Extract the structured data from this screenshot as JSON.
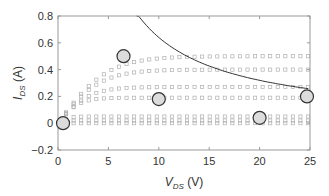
{
  "chart_data": {
    "type": "scatter",
    "title": "",
    "xlabel": "V_DS (V)",
    "xlabel_main": "V",
    "xlabel_sub": "DS",
    "xlabel_unit": " (V)",
    "ylabel": "I_DS (A)",
    "ylabel_main": "I",
    "ylabel_sub": "DS",
    "ylabel_unit": " (A)",
    "xlim": [
      0,
      25
    ],
    "ylim": [
      -0.2,
      0.8
    ],
    "xticks": [
      0,
      5,
      10,
      15,
      20,
      25
    ],
    "yticks": [
      -0.2,
      0,
      0.2,
      0.4,
      0.6,
      0.8
    ],
    "xtick_labels": [
      "0",
      "5",
      "10",
      "15",
      "20",
      "25"
    ],
    "ytick_labels": [
      "−0.2",
      "0",
      "0.2",
      "0.4",
      "0.6",
      "0.8"
    ],
    "grid": false,
    "legend": null,
    "series": [
      {
        "name": "I-V curve 1",
        "marker": "square",
        "saturation_current": 0.5,
        "knee_voltage": 7
      },
      {
        "name": "I-V curve 2",
        "marker": "square",
        "saturation_current": 0.4,
        "knee_voltage": 6
      },
      {
        "name": "I-V curve 3",
        "marker": "square",
        "saturation_current": 0.27,
        "knee_voltage": 4.5
      },
      {
        "name": "I-V curve 4",
        "marker": "square",
        "saturation_current": 0.19,
        "knee_voltage": 3
      },
      {
        "name": "I-V curve 5",
        "marker": "square",
        "saturation_current": 0.05,
        "knee_voltage": 1.5
      },
      {
        "name": "I-V curve 6",
        "marker": "square",
        "saturation_current": 0.02,
        "knee_voltage": 1
      },
      {
        "name": "I-V curve 7",
        "marker": "square",
        "saturation_current": 0.0,
        "knee_voltage": 0.5
      }
    ],
    "power_limit_curve": {
      "name": "max power hyperbola",
      "style": "solid line",
      "power_W": 6.4,
      "x_start": 7.8,
      "x_end": 25
    },
    "highlight_points": [
      {
        "x": 0.5,
        "y": 0.0
      },
      {
        "x": 6.5,
        "y": 0.5
      },
      {
        "x": 10,
        "y": 0.18
      },
      {
        "x": 20,
        "y": 0.04
      },
      {
        "x": 24.7,
        "y": 0.2
      }
    ],
    "colors": {
      "markers": "#b0b0b0",
      "curve": "#333333",
      "circle_fill": "#dcdcdc",
      "circle_stroke": "#333333",
      "axis": "#9a9a9a"
    }
  }
}
